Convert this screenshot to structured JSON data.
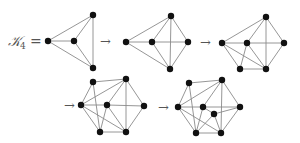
{
  "label": {
    "main": "𝒦",
    "subscript": "4",
    "equals": "="
  },
  "arrow_glyph": "→",
  "colors": {
    "edge": "#8a8a8a",
    "node": "#111111",
    "text": "#555555"
  },
  "arrows": [
    {
      "x": 100,
      "y": 46
    },
    {
      "x": 200,
      "y": 47
    },
    {
      "x": 64,
      "y": 110
    },
    {
      "x": 158,
      "y": 112
    }
  ],
  "graphs": [
    {
      "name": "graph-1-K4",
      "nodes": [
        [
          48,
          41
        ],
        [
          74,
          41
        ],
        [
          93,
          15
        ],
        [
          93,
          68
        ]
      ],
      "edges": [
        [
          0,
          1
        ],
        [
          0,
          2
        ],
        [
          0,
          3
        ],
        [
          1,
          2
        ],
        [
          1,
          3
        ],
        [
          2,
          3
        ]
      ]
    },
    {
      "name": "graph-2",
      "nodes": [
        [
          126,
          42
        ],
        [
          152,
          42
        ],
        [
          171,
          16
        ],
        [
          188,
          42
        ],
        [
          170,
          69
        ]
      ],
      "edges": [
        [
          0,
          2
        ],
        [
          0,
          4
        ],
        [
          0,
          1
        ],
        [
          1,
          3
        ],
        [
          1,
          2
        ],
        [
          1,
          4
        ],
        [
          2,
          3
        ],
        [
          2,
          4
        ],
        [
          3,
          4
        ]
      ]
    },
    {
      "name": "graph-3",
      "nodes": [
        [
          222,
          43
        ],
        [
          247,
          43
        ],
        [
          266,
          17
        ],
        [
          284,
          43
        ],
        [
          240,
          69
        ],
        [
          266,
          69
        ]
      ],
      "edges": [
        [
          0,
          2
        ],
        [
          0,
          1
        ],
        [
          1,
          3
        ],
        [
          1,
          2
        ],
        [
          2,
          3
        ],
        [
          2,
          5
        ],
        [
          3,
          5
        ],
        [
          0,
          4
        ],
        [
          0,
          5
        ],
        [
          1,
          4
        ],
        [
          1,
          5
        ],
        [
          4,
          5
        ]
      ]
    },
    {
      "name": "graph-4",
      "nodes": [
        [
          81,
          105
        ],
        [
          93,
          82
        ],
        [
          126,
          79
        ],
        [
          107,
          105
        ],
        [
          144,
          106
        ],
        [
          100,
          132
        ],
        [
          126,
          132
        ]
      ],
      "edges": [
        [
          0,
          1
        ],
        [
          1,
          2
        ],
        [
          0,
          2
        ],
        [
          0,
          3
        ],
        [
          3,
          4
        ],
        [
          0,
          5
        ],
        [
          0,
          6
        ],
        [
          1,
          5
        ],
        [
          3,
          2
        ],
        [
          3,
          6
        ],
        [
          3,
          5
        ],
        [
          2,
          4
        ],
        [
          2,
          6
        ],
        [
          4,
          6
        ],
        [
          5,
          6
        ]
      ]
    },
    {
      "name": "graph-5",
      "nodes": [
        [
          178,
          107
        ],
        [
          189,
          83
        ],
        [
          222,
          80
        ],
        [
          203,
          107
        ],
        [
          240,
          107
        ],
        [
          214,
          114
        ],
        [
          196,
          133
        ],
        [
          221,
          133
        ]
      ],
      "edges": [
        [
          0,
          1
        ],
        [
          1,
          2
        ],
        [
          0,
          2
        ],
        [
          0,
          3
        ],
        [
          3,
          4
        ],
        [
          0,
          6
        ],
        [
          0,
          7
        ],
        [
          1,
          6
        ],
        [
          3,
          2
        ],
        [
          3,
          6
        ],
        [
          2,
          4
        ],
        [
          2,
          7
        ],
        [
          4,
          7
        ],
        [
          6,
          7
        ],
        [
          3,
          5
        ],
        [
          5,
          4
        ],
        [
          5,
          6
        ],
        [
          5,
          7
        ]
      ]
    }
  ]
}
